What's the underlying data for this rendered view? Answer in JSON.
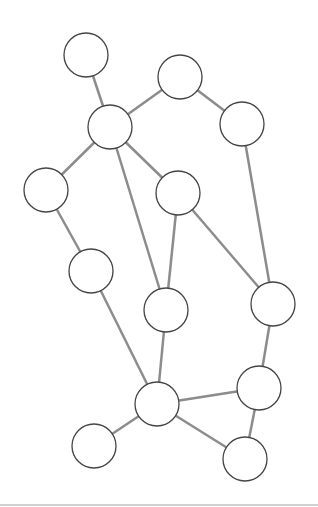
{
  "diagram": {
    "type": "undirected-graph",
    "node_radius": 22,
    "colors": {
      "edge": "#8c8c8c",
      "node_stroke": "#444444",
      "node_fill": "#ffffff",
      "background": "#ffffff"
    },
    "nodes": [
      {
        "id": "n1",
        "x": 86,
        "y": 55
      },
      {
        "id": "n2",
        "x": 110,
        "y": 127
      },
      {
        "id": "n3",
        "x": 180,
        "y": 77
      },
      {
        "id": "n4",
        "x": 242,
        "y": 124
      },
      {
        "id": "n5",
        "x": 46,
        "y": 190
      },
      {
        "id": "n6",
        "x": 178,
        "y": 193
      },
      {
        "id": "n7",
        "x": 91,
        "y": 271
      },
      {
        "id": "n8",
        "x": 166,
        "y": 310
      },
      {
        "id": "n9",
        "x": 273,
        "y": 304
      },
      {
        "id": "n10",
        "x": 157,
        "y": 404
      },
      {
        "id": "n11",
        "x": 259,
        "y": 388
      },
      {
        "id": "n12",
        "x": 94,
        "y": 446
      },
      {
        "id": "n13",
        "x": 245,
        "y": 459
      }
    ],
    "edges": [
      [
        "n1",
        "n2"
      ],
      [
        "n2",
        "n3"
      ],
      [
        "n3",
        "n4"
      ],
      [
        "n2",
        "n5"
      ],
      [
        "n2",
        "n8"
      ],
      [
        "n2",
        "n6"
      ],
      [
        "n4",
        "n9"
      ],
      [
        "n5",
        "n7"
      ],
      [
        "n6",
        "n8"
      ],
      [
        "n6",
        "n9"
      ],
      [
        "n7",
        "n10"
      ],
      [
        "n8",
        "n10"
      ],
      [
        "n9",
        "n11"
      ],
      [
        "n10",
        "n11"
      ],
      [
        "n10",
        "n12"
      ],
      [
        "n10",
        "n13"
      ],
      [
        "n11",
        "n13"
      ]
    ]
  }
}
